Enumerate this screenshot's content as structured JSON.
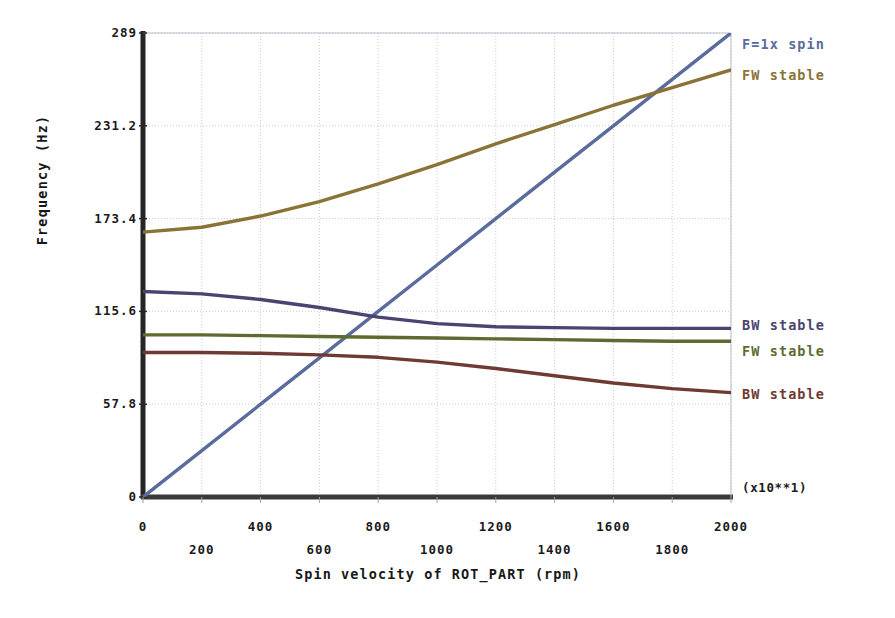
{
  "chart_data": {
    "type": "line",
    "title": "",
    "xlabel": "Spin velocity of ROT_PART (rpm)",
    "ylabel": "Frequency (Hz)",
    "exponent_note": "(x10**1)",
    "xlim": [
      0,
      2000
    ],
    "ylim": [
      0,
      289
    ],
    "grid": true,
    "legend_position": "right",
    "x_ticks_upper": [
      "0",
      "400",
      "800",
      "1200",
      "1600",
      "2000"
    ],
    "x_ticks_lower": [
      "200",
      "600",
      "1000",
      "1400",
      "1800"
    ],
    "x_tick_values_upper": [
      0,
      400,
      800,
      1200,
      1600,
      2000
    ],
    "x_tick_values_lower": [
      200,
      600,
      1000,
      1400,
      1800
    ],
    "y_ticks": [
      "0",
      "57.8",
      "115.6",
      "173.4",
      "231.2",
      "289"
    ],
    "y_tick_values": [
      0,
      57.8,
      115.6,
      173.4,
      231.2,
      289
    ],
    "x": [
      0,
      200,
      400,
      600,
      800,
      1000,
      1200,
      1400,
      1600,
      1800,
      2000
    ],
    "series": [
      {
        "name": "F=1x spin",
        "label": "F=1x spin",
        "color": "#5a6b9e",
        "legend_anchor": "top",
        "values": [
          0,
          28.9,
          57.8,
          86.7,
          115.6,
          144.5,
          173.4,
          202.3,
          231.2,
          260.1,
          289
        ]
      },
      {
        "name": "FW stable (high)",
        "label": "FW stable",
        "color": "#8a7336",
        "legend_anchor": "top",
        "values": [
          165,
          168,
          175,
          184,
          195,
          207,
          220,
          232,
          244,
          255,
          266
        ]
      },
      {
        "name": "BW stable (upper)",
        "label": "BW stable",
        "color": "#4a4470",
        "legend_anchor": "right",
        "values": [
          128,
          126.5,
          123,
          118,
          112,
          108,
          106,
          105.5,
          105,
          105,
          105
        ]
      },
      {
        "name": "FW stable (low)",
        "label": "FW stable",
        "color": "#5d6b33",
        "legend_anchor": "right",
        "values": [
          101,
          101,
          100.5,
          100,
          99.5,
          99,
          98.5,
          98,
          97.5,
          97,
          97
        ]
      },
      {
        "name": "BW stable (lower)",
        "label": "BW stable",
        "color": "#6e3b33",
        "legend_anchor": "right",
        "values": [
          90,
          90,
          89.5,
          88.5,
          87,
          84,
          80,
          75.5,
          71,
          67.5,
          65
        ]
      }
    ]
  }
}
